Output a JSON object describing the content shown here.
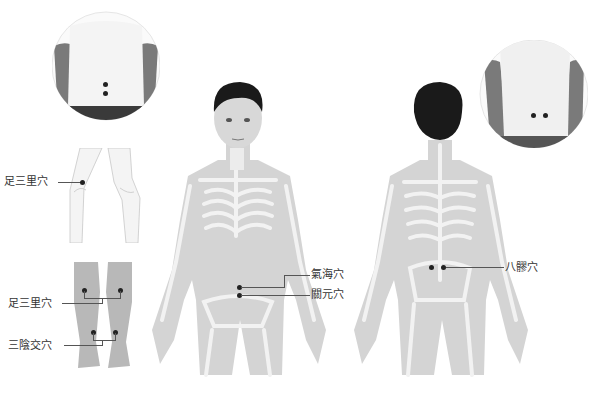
{
  "colors": {
    "body_fill": "#d4d4d4",
    "bone_fill": "#f2f2f2",
    "hair": "#1a1a1a",
    "point": "#222222",
    "leader_line": "#555555",
    "label_text": "#333333"
  },
  "labels": {
    "zusanli_side": "足三里穴",
    "zusanli_front": "足三里穴",
    "sanyinjiao": "三陰交穴",
    "qihai": "氣海穴",
    "guanyuan": "關元穴",
    "baliao": "八髎穴"
  },
  "insets": {
    "back_lower_photo": {
      "points": 2,
      "arrangement": "vertical"
    },
    "back_sacral_photo": {
      "points": 2,
      "arrangement": "horizontal"
    },
    "knee_side_illustration": {
      "points": 1
    },
    "legs_front_photo": {
      "points": 4
    }
  },
  "figures": {
    "front": {
      "view": "anterior",
      "points": 2
    },
    "back": {
      "view": "posterior",
      "points": 2
    }
  }
}
